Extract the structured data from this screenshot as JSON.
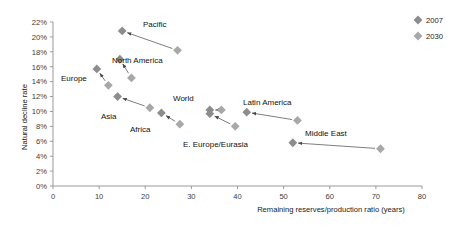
{
  "chart_data": {
    "type": "scatter",
    "title": "",
    "xlabel": "Remaining reserves/production ratio (years)",
    "ylabel": "Natural decline rate",
    "xlim": [
      0,
      80
    ],
    "ylim": [
      0,
      22
    ],
    "xticks": [
      "0",
      "10",
      "20",
      "30",
      "40",
      "50",
      "60",
      "70",
      "80"
    ],
    "xtick_values": [
      0,
      10,
      20,
      30,
      40,
      50,
      60,
      70,
      80
    ],
    "yticks": [
      "0%",
      "2%",
      "4%",
      "6%",
      "8%",
      "10%",
      "12%",
      "14%",
      "16%",
      "18%",
      "20%",
      "22%"
    ],
    "ytick_values": [
      0,
      2,
      4,
      6,
      8,
      10,
      12,
      14,
      16,
      18,
      20,
      22
    ],
    "grid": false,
    "legend_position": "top-right",
    "series": [
      {
        "name": "2007",
        "color": "#8d8d8d"
      },
      {
        "name": "2030",
        "color": "#a8a8a8"
      }
    ],
    "points": [
      {
        "region": "Pacific",
        "x2007": 15.0,
        "y2007": 20.8,
        "x2030": 27.0,
        "y2030": 18.2
      },
      {
        "region": "North America",
        "x2007": 14.5,
        "y2007": 17.0,
        "x2030": 17.0,
        "y2030": 14.5
      },
      {
        "region": "Europe",
        "x2007": 9.5,
        "y2007": 15.7,
        "x2030": 12.0,
        "y2030": 13.5
      },
      {
        "region": "Asia",
        "x2007": 14.0,
        "y2007": 12.0,
        "x2030": 21.0,
        "y2030": 10.5
      },
      {
        "region": "Africa",
        "x2007": 23.5,
        "y2007": 9.8,
        "x2030": 27.5,
        "y2030": 8.3
      },
      {
        "region": "World",
        "x2007": 34.0,
        "y2007": 10.2,
        "x2030": 36.5,
        "y2030": 10.2
      },
      {
        "region": "Latin America",
        "x2007": 42.0,
        "y2007": 9.9,
        "x2030": 53.0,
        "y2030": 8.8
      },
      {
        "region": "E. Europe/Eurasia",
        "x2007": 34.0,
        "y2007": 9.7,
        "x2030": 39.5,
        "y2030": 8.0
      },
      {
        "region": "Middle East",
        "x2007": 52.0,
        "y2007": 5.8,
        "x2030": 71.0,
        "y2030": 5.0
      }
    ],
    "annotations": [
      {
        "text": "Pacific",
        "x": 143,
        "y": 27
      },
      {
        "text": "North America",
        "x": 112,
        "y": 63
      },
      {
        "text": "Europe",
        "x": 61,
        "y": 81
      },
      {
        "text": "Asia",
        "x": 101,
        "y": 119
      },
      {
        "text": "Africa",
        "x": 130,
        "y": 132
      },
      {
        "text": "World",
        "x": 173,
        "y": 101
      },
      {
        "text": "Latin America",
        "x": 243,
        "y": 105
      },
      {
        "text": "E. Europe/Eurasia",
        "x": 183,
        "y": 147
      },
      {
        "text": "Middle East",
        "x": 305,
        "y": 136
      }
    ]
  },
  "legend": {
    "entries": [
      {
        "label": "2007",
        "color": "#8d8d8d"
      },
      {
        "label": "2030",
        "color": "#a8a8a8"
      }
    ]
  }
}
